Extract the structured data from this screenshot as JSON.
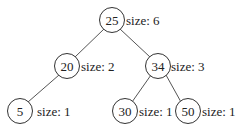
{
  "diagram": {
    "type": "binary-search-tree",
    "size_prefix": "size: ",
    "nodes": [
      {
        "id": "n25",
        "value": "25",
        "size_label": "size: 6",
        "cx": 112,
        "cy": 20
      },
      {
        "id": "n20",
        "value": "20",
        "size_label": "size: 2",
        "cx": 67,
        "cy": 66
      },
      {
        "id": "n34",
        "value": "34",
        "size_label": "size: 3",
        "cx": 158,
        "cy": 66
      },
      {
        "id": "n5",
        "value": "5",
        "size_label": "size: 1",
        "cx": 20,
        "cy": 111
      },
      {
        "id": "n30",
        "value": "30",
        "size_label": "size: 1",
        "cx": 125,
        "cy": 111
      },
      {
        "id": "n50",
        "value": "50",
        "size_label": "size: 1",
        "cx": 188,
        "cy": 111
      }
    ],
    "edges": [
      {
        "from": "25",
        "to": "20"
      },
      {
        "from": "25",
        "to": "34"
      },
      {
        "from": "20",
        "to": "5"
      },
      {
        "from": "34",
        "to": "30"
      },
      {
        "from": "34",
        "to": "50"
      }
    ],
    "colors": {
      "node_stroke": "#333333",
      "edge": "#555555",
      "text": "#222222",
      "background": "#ffffff"
    }
  }
}
